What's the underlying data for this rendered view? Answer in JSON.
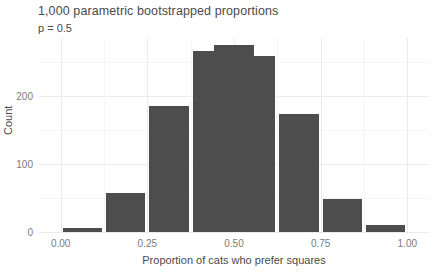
{
  "chart_data": {
    "type": "bar",
    "title": "1,000 parametric bootstrapped proportions",
    "subtitle": "p = 0.5",
    "xlabel": "Proportion of cats who prefer squares",
    "ylabel": "Count",
    "xlim": [
      -0.0625,
      1.0625
    ],
    "ylim": [
      0,
      285
    ],
    "grid": true,
    "legend": false,
    "bar_color": "#4d4d4d",
    "panel_background": "#ffffff",
    "bin_width": 0.125,
    "categories": [
      "0.0625",
      "0.1875",
      "0.3125",
      "0.4375",
      "0.5",
      "0.5625",
      "0.6875",
      "0.8125",
      "0.9375"
    ],
    "x": [
      0.0625,
      0.1875,
      0.3125,
      0.4375,
      0.5,
      0.5625,
      0.6875,
      0.8125,
      0.9375
    ],
    "values": [
      6,
      57,
      185,
      266,
      275,
      258,
      174,
      48,
      10
    ],
    "bars": [
      {
        "center": 0.0625,
        "count": 6
      },
      {
        "center": 0.1875,
        "count": 57
      },
      {
        "center": 0.3125,
        "count": 185
      },
      {
        "center": 0.4375,
        "count": 266
      },
      {
        "center": 0.5,
        "count": 275
      },
      {
        "center": 0.5625,
        "count": 258
      },
      {
        "center": 0.6875,
        "count": 174
      },
      {
        "center": 0.8125,
        "count": 48
      },
      {
        "center": 0.9375,
        "count": 10
      }
    ],
    "xticks": [
      0.0,
      0.25,
      0.5,
      0.75,
      1.0
    ],
    "xtick_labels": [
      "0.00",
      "0.25",
      "0.50",
      "0.75",
      "1.00"
    ],
    "yticks": [
      0,
      100,
      200
    ],
    "ytick_labels": [
      "0",
      "100",
      "200"
    ],
    "xticks_minor": [
      0.125,
      0.375,
      0.625,
      0.875
    ],
    "yticks_minor": [
      50,
      150,
      250
    ]
  }
}
